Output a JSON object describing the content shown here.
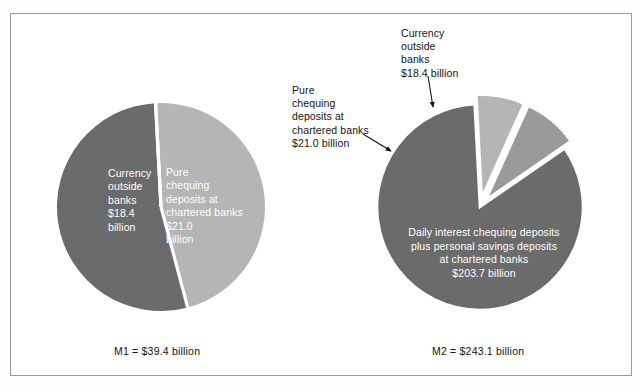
{
  "figure": {
    "background_color": "#ffffff",
    "border_color": "#9a9a9a"
  },
  "palette": {
    "light_gray": "#b5b5b5",
    "medium_gray": "#9a9a9a",
    "dark_gray": "#6b6b6b",
    "divider": "#ffffff",
    "text_dark": "#141414",
    "text_light": "#ffffff"
  },
  "annotations": {
    "pure_chequing": "Pure\nchequing\ndeposits at\nchartered banks\n$21.0 billion",
    "currency_outside": "Currency\noutside\nbanks\n$18.4 billion"
  },
  "m1": {
    "caption": "M1 = $39.4 billion",
    "slice_labels": {
      "currency": "Currency\noutside\nbanks\n$18.4\nbillion",
      "pure_chequing": "Pure\nchequing\ndeposits at\nchartered banks\n$21.0\nbillion"
    }
  },
  "m2": {
    "caption": "M2 = $243.1 billion",
    "slice_labels": {
      "daily_interest": "Daily interest chequing deposits\nplus personal savings deposits\nat chartered banks\n$203.7 billion"
    }
  },
  "chart_data": [
    {
      "type": "pie",
      "title": "M1 = $39.4 billion",
      "id": "M1",
      "total": 39.4,
      "units": "billion CAD",
      "legend": "none",
      "categories": [
        "Currency outside banks",
        "Pure chequing deposits at chartered banks"
      ],
      "values": [
        18.4,
        21.0
      ],
      "value_labels": [
        "$18.4 billion",
        "$21.0 billion"
      ],
      "percentages": [
        46.7,
        53.3
      ],
      "angles_deg": [
        168.1,
        191.9
      ],
      "colors": [
        "#b5b5b5",
        "#6b6b6b"
      ],
      "exploded": [
        false,
        false
      ],
      "start_angle_deg": -3
    },
    {
      "type": "pie",
      "title": "M2 = $243.1 billion",
      "id": "M2",
      "total": 243.1,
      "units": "billion CAD",
      "legend": "none",
      "categories": [
        "Currency outside banks",
        "Pure chequing deposits at chartered banks",
        "Daily interest chequing deposits plus personal savings deposits at chartered banks"
      ],
      "values": [
        18.4,
        21.0,
        203.7
      ],
      "value_labels": [
        "$18.4 billion",
        "$21.0 billion",
        "$203.7 billion"
      ],
      "percentages": [
        7.6,
        8.6,
        83.8
      ],
      "angles_deg": [
        27.2,
        31.1,
        301.7
      ],
      "colors": [
        "#b5b5b5",
        "#9a9a9a",
        "#6b6b6b"
      ],
      "exploded": [
        true,
        true,
        false
      ],
      "start_angle_deg": -3
    }
  ]
}
